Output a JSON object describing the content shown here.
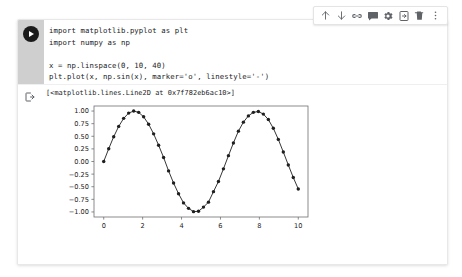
{
  "toolbar": {
    "buttons": [
      {
        "name": "move-cell-up-icon",
        "label": "Move cell up"
      },
      {
        "name": "move-cell-down-icon",
        "label": "Move cell down"
      },
      {
        "name": "link-to-cell-icon",
        "label": "Link to cell"
      },
      {
        "name": "add-comment-icon",
        "label": "Add comment"
      },
      {
        "name": "cell-settings-gear-icon",
        "label": "Settings"
      },
      {
        "name": "mirror-cell-icon",
        "label": "Mirror cell in tab"
      },
      {
        "name": "delete-cell-icon",
        "label": "Delete cell"
      },
      {
        "name": "more-options-icon",
        "label": "More cell actions"
      }
    ]
  },
  "cell": {
    "run_button_label": "Run cell",
    "output_icon_label": "Cell output",
    "code_lines": [
      "import matplotlib.pyplot as plt",
      "import numpy as np",
      "",
      "x = np.linspace(0, 10, 40)",
      "plt.plot(x, np.sin(x), marker='o', linestyle='-')"
    ],
    "output_text": "[<matplotlib.lines.Line2D at 0x7f782eb6ac10>]"
  },
  "chart_data": {
    "type": "line",
    "title": "",
    "xlabel": "",
    "ylabel": "",
    "xlim": [
      -0.5,
      10.5
    ],
    "ylim": [
      -1.1,
      1.1
    ],
    "grid": false,
    "legend": null,
    "marker": "o",
    "linestyle": "-",
    "line_color": "#1f1f1f",
    "marker_color": "#1f1f1f",
    "xticks": [
      0,
      2,
      4,
      6,
      8,
      10
    ],
    "xticklabels": [
      "0",
      "2",
      "4",
      "6",
      "8",
      "10"
    ],
    "yticks": [
      1.0,
      0.75,
      0.5,
      0.25,
      0.0,
      -0.25,
      -0.5,
      -0.75,
      -1.0
    ],
    "yticklabels": [
      "1.00",
      "0.75",
      "0.50",
      "0.25",
      "0.00",
      "−0.25",
      "−0.50",
      "−0.75",
      "−1.00"
    ],
    "series": [
      {
        "name": "np.sin(x)",
        "x": [
          0.0,
          0.2564,
          0.5128,
          0.7692,
          1.0256,
          1.2821,
          1.5385,
          1.7949,
          2.0513,
          2.3077,
          2.5641,
          2.8205,
          3.0769,
          3.3333,
          3.5897,
          3.8462,
          4.1026,
          4.359,
          4.6154,
          4.8718,
          5.1282,
          5.3846,
          5.641,
          5.8974,
          6.1538,
          6.4103,
          6.6667,
          6.9231,
          7.1795,
          7.4359,
          7.6923,
          7.9487,
          8.2051,
          8.4615,
          8.7179,
          8.9744,
          9.2308,
          9.4872,
          9.7436,
          10.0
        ],
        "y": [
          0.0,
          0.2537,
          0.4904,
          0.6952,
          0.8556,
          0.9597,
          0.9997,
          0.9741,
          0.8855,
          0.7396,
          0.5479,
          0.3232,
          0.0804,
          -0.1865,
          -0.4262,
          -0.6384,
          -0.8201,
          -0.9281,
          -0.9936,
          -0.9866,
          -0.9042,
          -0.8055,
          -0.5977,
          -0.3955,
          -0.1455,
          0.1155,
          0.3673,
          0.6016,
          0.7795,
          0.9041,
          0.974,
          0.9916,
          0.9394,
          0.8322,
          0.6576,
          0.438,
          0.1884,
          -0.0685,
          -0.3165,
          -0.544
        ]
      }
    ]
  }
}
